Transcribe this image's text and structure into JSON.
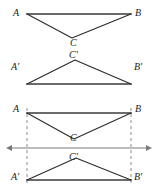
{
  "figure": {
    "type": "geometry-diagram",
    "canvas": {
      "width": 157,
      "height": 192,
      "background": "#ffffff"
    },
    "style": {
      "stroke_color": "#2b2b2b",
      "base_stroke_color": "#6b6b6b",
      "dashed_color": "#8c8c8c",
      "axis_color": "#7a7a7a",
      "stroke_width": 1.1,
      "base_stroke_width": 2.2,
      "dash_pattern": "3 3"
    },
    "panels": [
      {
        "name": "top-panel",
        "shapes": [
          {
            "name": "triangle-ABC",
            "kind": "triangle",
            "orientation": "apex-down",
            "vertices": [
              {
                "id": "A",
                "x": 27,
                "y": 14
              },
              {
                "id": "B",
                "x": 131,
                "y": 14
              },
              {
                "id": "C",
                "x": 72,
                "y": 38
              }
            ],
            "base_edge": {
              "from": "A",
              "to": "B"
            }
          }
        ]
      },
      {
        "name": "middle-panel",
        "shapes": [
          {
            "name": "triangle-A-prime-B-prime-C-prime",
            "kind": "triangle",
            "orientation": "apex-up",
            "vertices": [
              {
                "id": "A'",
                "x": 27,
                "y": 84
              },
              {
                "id": "B'",
                "x": 131,
                "y": 84
              },
              {
                "id": "C'",
                "x": 75,
                "y": 60
              }
            ],
            "base_edge": {
              "from": "A'",
              "to": "B'"
            }
          }
        ]
      },
      {
        "name": "bottom-panel",
        "shapes": [
          {
            "name": "triangle-ABC",
            "kind": "triangle",
            "orientation": "apex-down",
            "vertices": [
              {
                "id": "A",
                "x": 27,
                "y": 113
              },
              {
                "id": "B",
                "x": 131,
                "y": 113
              },
              {
                "id": "C",
                "x": 74,
                "y": 139
              }
            ],
            "base_edge": {
              "from": "A",
              "to": "B"
            }
          },
          {
            "name": "triangle-A-prime-B-prime-C-prime",
            "kind": "triangle",
            "orientation": "apex-up",
            "vertices": [
              {
                "id": "A'",
                "x": 27,
                "y": 180
              },
              {
                "id": "B'",
                "x": 131,
                "y": 180
              },
              {
                "id": "C'",
                "x": 76,
                "y": 158
              }
            ],
            "base_edge": {
              "from": "A'",
              "to": "B'"
            }
          }
        ],
        "mirror_axis": {
          "name": "mirror-line",
          "kind": "double-arrow-line",
          "y": 148,
          "x_start": 12,
          "x_end": 146,
          "arrow_left": true,
          "arrow_right": true
        },
        "correspondence_lines": [
          {
            "name": "dashed-line-A-to-A-prime",
            "x": 27,
            "y_start": 108,
            "y_end": 186
          },
          {
            "name": "dashed-line-B-to-B-prime",
            "x": 131,
            "y_start": 108,
            "y_end": 186
          }
        ]
      }
    ],
    "labels": {
      "A": "A",
      "B": "B",
      "C": "C",
      "A_prime": "A'",
      "B_prime": "B'",
      "C_prime": "C'"
    }
  }
}
